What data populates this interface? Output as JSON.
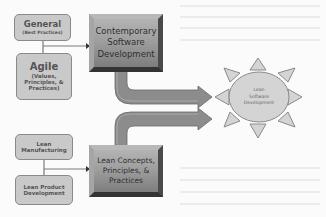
{
  "diagram": {
    "inputs_top": {
      "general": {
        "title": "General",
        "subtitle": "(Best Practices)"
      },
      "agile": {
        "title": "Agile",
        "subtitle_line1": "(Values,",
        "subtitle_line2": "Principles, &",
        "subtitle_line3": "Practices)"
      }
    },
    "contemporary": {
      "line1": "Contemporary",
      "line2": "Software",
      "line3": "Development"
    },
    "inputs_bottom": {
      "lean_manufacturing": {
        "line1": "Lean",
        "line2": "Manufacturing"
      },
      "lean_product": {
        "line1": "Lean Product",
        "line2": "Development"
      }
    },
    "lean_concepts": {
      "line1": "Lean Concepts,",
      "line2": "Principles, &",
      "line3": "Practices"
    },
    "sun": {
      "line1": "Lean",
      "line2": "Software",
      "line3": "Development"
    },
    "colors": {
      "box_fill": "#c9c9c9",
      "box_border": "#8a8a8a",
      "bevel_dark": "#3f3f3f",
      "arrow_fill": "#8c8c8c",
      "sun_fill": "#d4d4d4",
      "background": "#fbfbfb"
    }
  }
}
